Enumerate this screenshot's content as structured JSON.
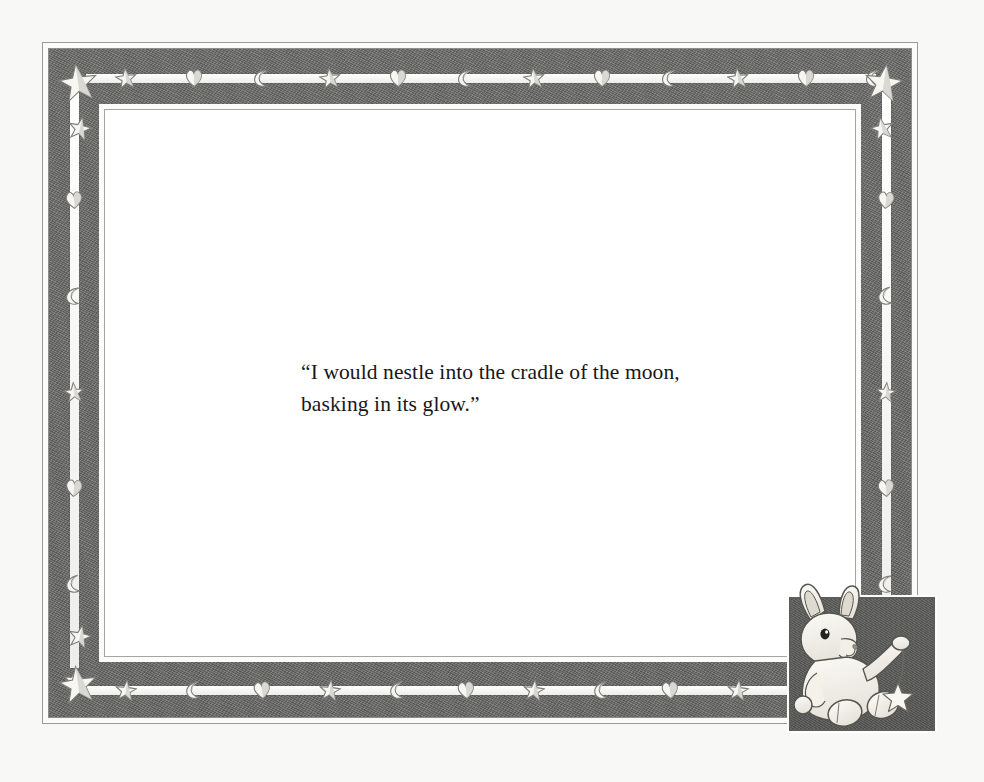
{
  "page": {
    "background_color": "#f8f8f7",
    "mat_color": "#ffffff",
    "border_band_color": "#6e6e6c",
    "ink_color": "#17171a"
  },
  "quote": {
    "line_1": "“I would nestle into the cradle of the moon,",
    "line_2": "basking in its glow.”",
    "full_text": "“I would nestle into the cradle of the moon, basking in its glow.”"
  },
  "border": {
    "style_note": "pencil-sketch celestial border",
    "top_motifs": [
      "star",
      "heart",
      "moon",
      "star",
      "heart",
      "moon",
      "star",
      "heart",
      "moon",
      "star",
      "heart",
      "moon"
    ],
    "bottom_motifs": [
      "star",
      "moon",
      "heart",
      "star",
      "moon",
      "heart",
      "star",
      "moon",
      "heart",
      "star",
      "moon",
      "heart"
    ],
    "left_motifs": [
      "heart",
      "moon",
      "star",
      "heart",
      "moon",
      "star"
    ],
    "right_motifs": [
      "heart",
      "moon",
      "star",
      "heart",
      "moon",
      "star"
    ],
    "corner_motifs": [
      "star-large",
      "star-small"
    ]
  },
  "illustration": {
    "subject": "bunny",
    "description": "bunny seated in a dark square frame holding a star on a string",
    "frame_fill": "#5f5f5d",
    "bunny_fill": "#f6f4ee",
    "held_object": "star"
  }
}
